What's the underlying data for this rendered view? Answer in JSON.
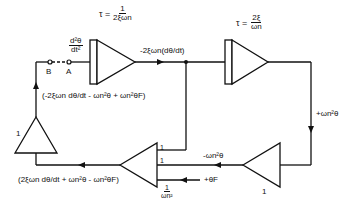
{
  "diagram": {
    "type": "analog-computer block diagram (second-order system)",
    "blocks": {
      "integrator_1": {
        "time_constant_label": "τ =",
        "time_constant_num": "1",
        "time_constant_den": "2ξωn",
        "input_label_num": "d²θ",
        "input_label_den": "dt²"
      },
      "integrator_2": {
        "time_constant_label": "τ =",
        "time_constant_num": "2ξ",
        "time_constant_den": "ωn"
      },
      "inverter": {
        "gain": "1"
      },
      "summer": {
        "gain_1": "1",
        "gain_2": "1",
        "gain_3_num": "1",
        "gain_3_den": "ωn²"
      },
      "feedback_amplifier": {
        "gain": "1"
      }
    },
    "switch": {
      "point_b": "B",
      "point_a": "A"
    },
    "signals": {
      "integrator1_output": "-2ξωn(dθ/dt)",
      "integrator2_output": "+ωn²θ",
      "inverter_output": "-ωn²θ",
      "external_input": "+θF",
      "summer_output": "(2ξωn dθ/dt + ωn²θ - ωn²θF)",
      "feedback_signal": "(-2ξωn dθ/dt - ωn²θ + ωn²θF)"
    },
    "colors": {
      "line": "#111111",
      "background": "#ffffff"
    }
  }
}
